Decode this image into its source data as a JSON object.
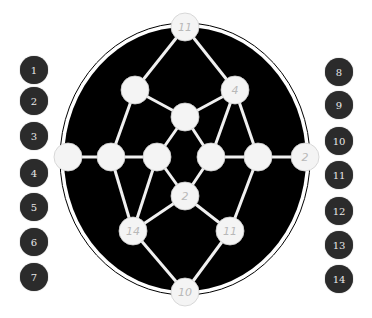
{
  "puzzle": {
    "board": {
      "oval": {
        "cx": 185,
        "cy": 159,
        "rx": 122,
        "ry": 133,
        "fill": "#000000",
        "ring": "#ffffff"
      },
      "node_radius": 14,
      "node_color": "#f4f4f4",
      "edge_color": "#f0f0f0",
      "nodes": [
        {
          "id": "n-top",
          "x": 185,
          "y": 27,
          "label": "11"
        },
        {
          "id": "n-upper-left",
          "x": 135,
          "y": 90,
          "label": ""
        },
        {
          "id": "n-upper-right",
          "x": 235,
          "y": 90,
          "label": "4"
        },
        {
          "id": "n-center-top",
          "x": 185,
          "y": 117,
          "label": ""
        },
        {
          "id": "n-far-left",
          "x": 68,
          "y": 157,
          "label": ""
        },
        {
          "id": "n-mid-left",
          "x": 111,
          "y": 157,
          "label": ""
        },
        {
          "id": "n-mid-center-left",
          "x": 157,
          "y": 157,
          "label": ""
        },
        {
          "id": "n-mid-center-right",
          "x": 211,
          "y": 157,
          "label": ""
        },
        {
          "id": "n-mid-right",
          "x": 258,
          "y": 157,
          "label": ""
        },
        {
          "id": "n-far-right",
          "x": 305,
          "y": 157,
          "label": "2"
        },
        {
          "id": "n-center-low",
          "x": 185,
          "y": 196,
          "label": "2"
        },
        {
          "id": "n-lower-left",
          "x": 133,
          "y": 231,
          "label": "14"
        },
        {
          "id": "n-lower-right",
          "x": 230,
          "y": 231,
          "label": "11"
        },
        {
          "id": "n-bottom",
          "x": 185,
          "y": 292,
          "label": "10"
        }
      ],
      "edges": [
        [
          "n-top",
          "n-upper-left"
        ],
        [
          "n-top",
          "n-upper-right"
        ],
        [
          "n-upper-left",
          "n-center-top"
        ],
        [
          "n-upper-right",
          "n-center-top"
        ],
        [
          "n-upper-left",
          "n-mid-left"
        ],
        [
          "n-upper-right",
          "n-mid-center-right"
        ],
        [
          "n-upper-right",
          "n-mid-right"
        ],
        [
          "n-center-top",
          "n-mid-center-left"
        ],
        [
          "n-center-top",
          "n-mid-center-right"
        ],
        [
          "n-far-left",
          "n-mid-left"
        ],
        [
          "n-mid-left",
          "n-mid-center-left"
        ],
        [
          "n-mid-center-right",
          "n-mid-right"
        ],
        [
          "n-mid-right",
          "n-far-right"
        ],
        [
          "n-mid-center-left",
          "n-center-low"
        ],
        [
          "n-mid-center-right",
          "n-center-low"
        ],
        [
          "n-mid-center-left",
          "n-lower-left"
        ],
        [
          "n-mid-left",
          "n-lower-left"
        ],
        [
          "n-center-low",
          "n-lower-left"
        ],
        [
          "n-center-low",
          "n-lower-right"
        ],
        [
          "n-mid-right",
          "n-lower-right"
        ],
        [
          "n-lower-left",
          "n-bottom"
        ],
        [
          "n-lower-right",
          "n-bottom"
        ]
      ]
    },
    "tokens_left": [
      {
        "label": "1",
        "x": 34,
        "y": 70
      },
      {
        "label": "2",
        "x": 34,
        "y": 101
      },
      {
        "label": "3",
        "x": 34,
        "y": 136
      },
      {
        "label": "4",
        "x": 34,
        "y": 173
      },
      {
        "label": "5",
        "x": 34,
        "y": 207
      },
      {
        "label": "6",
        "x": 34,
        "y": 242
      },
      {
        "label": "7",
        "x": 34,
        "y": 277
      }
    ],
    "tokens_right": [
      {
        "label": "8",
        "x": 339,
        "y": 72
      },
      {
        "label": "9",
        "x": 339,
        "y": 105
      },
      {
        "label": "10",
        "x": 339,
        "y": 141
      },
      {
        "label": "11",
        "x": 339,
        "y": 175
      },
      {
        "label": "12",
        "x": 339,
        "y": 211
      },
      {
        "label": "13",
        "x": 339,
        "y": 245
      },
      {
        "label": "14",
        "x": 339,
        "y": 279
      }
    ]
  }
}
